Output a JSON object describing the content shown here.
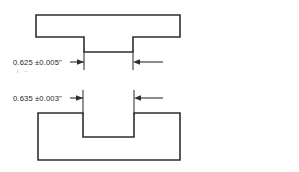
{
  "drawing": {
    "title": "Tenon and mortise fit detail",
    "background_color": "#ffffff",
    "line_color": "#2e2e2e",
    "text_color": "#1c1c1c",
    "dimensions": [
      {
        "id": "tenon-width",
        "label": "0.625 ±0.005\"",
        "nominal": "0.625",
        "tolerance": "±0.005",
        "unit": "\"",
        "applies_to": "tenon-width-upper-part"
      },
      {
        "id": "slot-width",
        "label": "0.635 ±0.003\"",
        "nominal": "0.635",
        "tolerance": "±0.003",
        "unit": "\"",
        "applies_to": "slot-width-lower-part"
      }
    ],
    "parts": [
      {
        "id": "upper-part",
        "name": "tenon-part",
        "description": "Horizontal bar with downward projecting tenon"
      },
      {
        "id": "lower-part",
        "name": "mortise-part",
        "description": "Block with rectangular slot cut from top edge"
      }
    ]
  }
}
